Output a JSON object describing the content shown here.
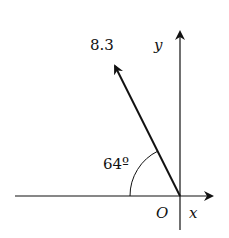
{
  "diagram": {
    "labels": {
      "magnitude": "8.3",
      "angle": "64º",
      "y_axis": "y",
      "x_axis": "x",
      "origin": "O"
    },
    "vector": {
      "magnitude": 8.3,
      "angle_from_negative_x_deg": 64
    },
    "colors": {
      "stroke": "#111111",
      "background": "#ffffff"
    }
  }
}
